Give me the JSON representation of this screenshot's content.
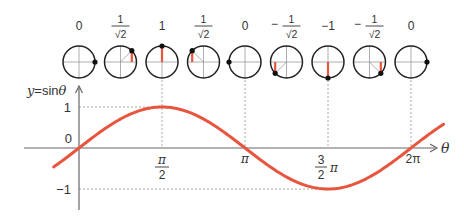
{
  "diagram": {
    "title_label": "y = sinθ",
    "y_axis_label_prefix": "y",
    "y_axis_label_func": "=sin",
    "y_axis_label_var": "θ",
    "x_axis_label": "θ",
    "y_ticks": [
      {
        "label": "1",
        "value": 1
      },
      {
        "label": "0",
        "value": 0
      },
      {
        "label": "−1",
        "value": -1
      }
    ],
    "x_ticks": [
      {
        "num": "π",
        "den": "2",
        "value": 1.5708
      },
      {
        "label": "π",
        "value": 3.1416
      },
      {
        "num": "3",
        "den": "2",
        "suffix": "π",
        "value": 4.7124
      },
      {
        "label": "2π",
        "value": 6.2832
      }
    ],
    "circles": [
      {
        "angle_deg": 0,
        "value_label": "0",
        "fraction": false,
        "sign": ""
      },
      {
        "angle_deg": 45,
        "value_label": "1",
        "fraction": true,
        "sign": "",
        "num": "1",
        "den": "√2"
      },
      {
        "angle_deg": 90,
        "value_label": "1",
        "fraction": false,
        "sign": ""
      },
      {
        "angle_deg": 135,
        "value_label": "1",
        "fraction": true,
        "sign": "",
        "num": "1",
        "den": "√2"
      },
      {
        "angle_deg": 180,
        "value_label": "0",
        "fraction": false,
        "sign": ""
      },
      {
        "angle_deg": 225,
        "value_label": "1",
        "fraction": true,
        "sign": "−",
        "num": "1",
        "den": "√2"
      },
      {
        "angle_deg": 270,
        "value_label": "−1",
        "fraction": false,
        "sign": ""
      },
      {
        "angle_deg": 315,
        "value_label": "1",
        "fraction": true,
        "sign": "−",
        "num": "1",
        "den": "√2"
      },
      {
        "angle_deg": 360,
        "value_label": "0",
        "fraction": false,
        "sign": ""
      }
    ],
    "colors": {
      "curve": "#e8553e",
      "sine_bar": "#e8553e",
      "axis": "#666666",
      "circle": "#222222",
      "dot": "#111111",
      "grid_dotted": "#aaaaaa",
      "text": "#333333"
    },
    "curve": {
      "function": "sin",
      "theta_start": -0.48,
      "theta_end": 6.9
    }
  }
}
